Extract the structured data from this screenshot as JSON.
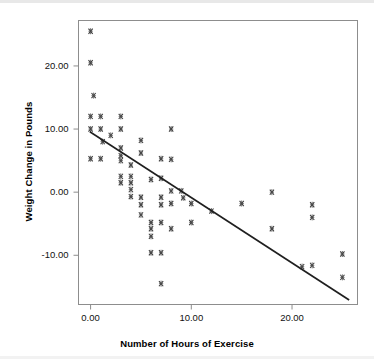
{
  "chart_data": {
    "type": "scatter",
    "title": "",
    "subtitle": "",
    "xlabel": "Number of Hours of Exercise",
    "ylabel": "Weight Change in Pounds",
    "xlim": [
      -1.2,
      26.5
    ],
    "ylim": [
      -17.8,
      27.2
    ],
    "xticks": [
      0,
      10,
      20
    ],
    "xticklabels": [
      "0.00",
      "10.00",
      "20.00"
    ],
    "yticks": [
      20,
      10,
      0,
      -10
    ],
    "yticklabels": [
      "20.00",
      "10.00",
      "0.00",
      "-10.00"
    ],
    "grid": false,
    "legend": false,
    "marker": "cross-hatch-square",
    "marker_color": "#3a3a3a",
    "frame_color": "#8d8d8d",
    "background": "#ffffff",
    "points": [
      {
        "x": 0.0,
        "y": 25.5
      },
      {
        "x": 0.0,
        "y": 20.5
      },
      {
        "x": 0.3,
        "y": 15.3
      },
      {
        "x": 0.0,
        "y": 12.0
      },
      {
        "x": 1.0,
        "y": 12.0
      },
      {
        "x": 3.0,
        "y": 12.0
      },
      {
        "x": 0.0,
        "y": 10.0
      },
      {
        "x": 1.0,
        "y": 10.0
      },
      {
        "x": 3.0,
        "y": 10.0
      },
      {
        "x": 8.0,
        "y": 10.0
      },
      {
        "x": 2.0,
        "y": 9.0
      },
      {
        "x": 1.2,
        "y": 8.0
      },
      {
        "x": 5.0,
        "y": 8.2
      },
      {
        "x": 3.0,
        "y": 7.0
      },
      {
        "x": 0.0,
        "y": 5.3
      },
      {
        "x": 1.0,
        "y": 5.3
      },
      {
        "x": 3.0,
        "y": 5.8
      },
      {
        "x": 3.0,
        "y": 5.0
      },
      {
        "x": 5.0,
        "y": 6.2
      },
      {
        "x": 7.0,
        "y": 5.3
      },
      {
        "x": 8.0,
        "y": 5.2
      },
      {
        "x": 4.0,
        "y": 4.3
      },
      {
        "x": 3.0,
        "y": 2.5
      },
      {
        "x": 4.0,
        "y": 2.5
      },
      {
        "x": 3.0,
        "y": 1.5
      },
      {
        "x": 4.0,
        "y": 1.5
      },
      {
        "x": 6.0,
        "y": 2.0
      },
      {
        "x": 7.0,
        "y": 2.2
      },
      {
        "x": 4.0,
        "y": 0.4
      },
      {
        "x": 8.0,
        "y": 0.2
      },
      {
        "x": 9.0,
        "y": 0.2
      },
      {
        "x": 18.0,
        "y": 0.0
      },
      {
        "x": 4.0,
        "y": -0.7
      },
      {
        "x": 5.0,
        "y": -0.8
      },
      {
        "x": 7.0,
        "y": -0.8
      },
      {
        "x": 9.2,
        "y": -0.9
      },
      {
        "x": 5.0,
        "y": -2.0
      },
      {
        "x": 7.0,
        "y": -2.0
      },
      {
        "x": 8.0,
        "y": -1.8
      },
      {
        "x": 10.0,
        "y": -1.8
      },
      {
        "x": 15.0,
        "y": -1.8
      },
      {
        "x": 22.0,
        "y": -2.0
      },
      {
        "x": 12.0,
        "y": -3.0
      },
      {
        "x": 5.0,
        "y": -3.6
      },
      {
        "x": 22.0,
        "y": -4.0
      },
      {
        "x": 6.0,
        "y": -4.8
      },
      {
        "x": 7.0,
        "y": -4.8
      },
      {
        "x": 10.0,
        "y": -4.8
      },
      {
        "x": 6.0,
        "y": -5.8
      },
      {
        "x": 8.0,
        "y": -5.8
      },
      {
        "x": 18.0,
        "y": -5.8
      },
      {
        "x": 6.0,
        "y": -7.0
      },
      {
        "x": 6.0,
        "y": -9.6
      },
      {
        "x": 7.0,
        "y": -9.6
      },
      {
        "x": 25.0,
        "y": -9.8
      },
      {
        "x": 21.0,
        "y": -11.8
      },
      {
        "x": 22.0,
        "y": -11.6
      },
      {
        "x": 7.0,
        "y": -14.5
      },
      {
        "x": 25.0,
        "y": -13.5
      }
    ],
    "trendline": {
      "label": "linear fit",
      "x_start": 0.0,
      "y_start": 9.5,
      "x_end": 25.6,
      "y_end": -17.0,
      "slope": -1.04,
      "intercept": 9.5,
      "color": "#1f1f1f"
    }
  }
}
